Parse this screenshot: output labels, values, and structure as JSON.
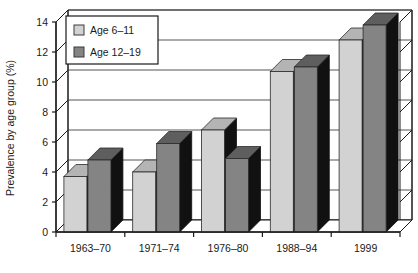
{
  "chart_data": {
    "type": "bar",
    "title": "",
    "xlabel": "",
    "ylabel": "Prevalence by age group (%)",
    "categories": [
      "1963–70",
      "1971–74",
      "1976–80",
      "1988–94",
      "1999"
    ],
    "series": [
      {
        "name": "Age 6–11",
        "values": [
          3.7,
          4.0,
          6.8,
          10.7,
          12.8
        ],
        "color": "#d2d2d2"
      },
      {
        "name": "Age 12–19",
        "values": [
          4.8,
          5.9,
          4.9,
          11.0,
          13.8
        ],
        "color": "#848484"
      }
    ],
    "ylim": [
      0,
      14
    ],
    "yticks": [
      0,
      2,
      4,
      6,
      8,
      10,
      12,
      14
    ],
    "ytick_labels": [
      "0",
      "2",
      "4",
      "6",
      "8",
      "10",
      "12",
      "14"
    ],
    "grid": true,
    "grid_axis": "y",
    "legend_position": "upper-left",
    "style_3d": true
  },
  "legend": {
    "items": [
      {
        "label": "Age 6–11",
        "swatch_name": "legend-swatch-age-6-11"
      },
      {
        "label": "Age 12–19",
        "swatch_name": "legend-swatch-age-12-19"
      }
    ]
  },
  "colors": {
    "series_light": "#d2d2d2",
    "series_dark": "#848484",
    "side_face": "#111111",
    "top_face_light": "#b4b4b4",
    "top_face_dark": "#5e5e5e",
    "axis": "#1a1a1a",
    "grid": "#555555",
    "background": "#ffffff"
  }
}
